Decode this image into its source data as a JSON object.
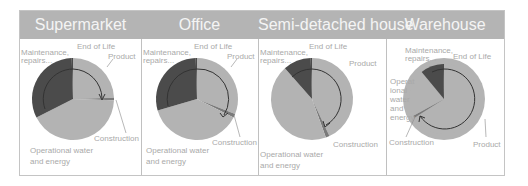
{
  "chart_data": [
    {
      "type": "pie",
      "title": "Supermarket",
      "categories": [
        "Product",
        "Construction",
        "Operational water and energy",
        "Maintenance, repairs...",
        "End of Life"
      ],
      "values": [
        24.5,
        1,
        42,
        32,
        0.5
      ],
      "legend": "none (direct labels)"
    },
    {
      "type": "pie",
      "title": "Office",
      "categories": [
        "Product",
        "Construction",
        "Operational water and energy",
        "Maintenance, repairs...",
        "End of Life"
      ],
      "values": [
        31,
        1.5,
        38,
        29,
        0.5
      ]
    },
    {
      "type": "pie",
      "title": "Semi-detached house",
      "categories": [
        "Product",
        "Construction",
        "Operational water and energy",
        "Maintenance, repairs...",
        "End of Life"
      ],
      "values": [
        43,
        1.5,
        44,
        11,
        0.5
      ]
    },
    {
      "type": "pie",
      "title": "Warehouse",
      "categories": [
        "Product",
        "Construction",
        "Operational water and energy",
        "Maintenance, repairs...",
        "End of Life"
      ],
      "values": [
        66,
        1,
        22,
        10.5,
        0.5
      ]
    }
  ],
  "header": {
    "titles": [
      "Supermarket",
      "Office",
      "Semi-detached house",
      "Warehouse"
    ]
  },
  "labels": {
    "end_of_life": "End of Life",
    "product": "Product",
    "construction": "Construction",
    "maintenance_1": "Maintenance,",
    "maintenance_2": "repairs...",
    "operational_1": "Operational water",
    "operational_2": "and energy",
    "op_w1": "Operat",
    "op_w2": "ional",
    "op_w3": "water",
    "op_w4": "and",
    "op_w5": "energy"
  },
  "colors": {
    "header_bg": "#b4b4b4",
    "header_text": "#f4f4f4",
    "slice_light": "#b3b3b3",
    "slice_dark": "#4b4b4b",
    "slice_construction": "#7a7a7a",
    "label_text": "#a9a9a9",
    "arrow": "#333333"
  }
}
